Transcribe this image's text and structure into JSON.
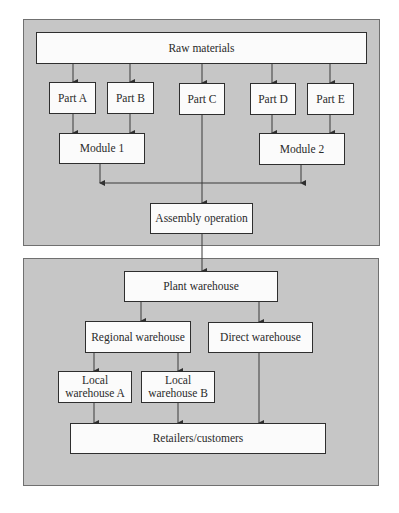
{
  "diagram": {
    "type": "supply-chain flowchart",
    "colors": {
      "panel": "#c6c6c6",
      "box": "#fbfbfb",
      "border": "#2e2e2e",
      "line": "#3a3a3a"
    },
    "panels": [
      {
        "id": "production",
        "label": ""
      },
      {
        "id": "distribution",
        "label": ""
      }
    ],
    "nodes": {
      "raw_materials": "Raw materials",
      "part_a": "Part A",
      "part_b": "Part B",
      "part_c": "Part C",
      "part_d": "Part D",
      "part_e": "Part E",
      "module_1": "Module 1",
      "module_2": "Module 2",
      "assembly": "Assembly operation",
      "plant_warehouse": "Plant warehouse",
      "regional_warehouse": "Regional warehouse",
      "direct_warehouse": "Direct warehouse",
      "local_warehouse_a": "Local\nwarehouse A",
      "local_warehouse_b": "Local\nwarehouse B",
      "retailers": "Retailers/customers"
    },
    "edges": [
      [
        "raw_materials",
        "part_a"
      ],
      [
        "raw_materials",
        "part_b"
      ],
      [
        "raw_materials",
        "part_c"
      ],
      [
        "raw_materials",
        "part_d"
      ],
      [
        "raw_materials",
        "part_e"
      ],
      [
        "part_a",
        "module_1"
      ],
      [
        "part_b",
        "module_1"
      ],
      [
        "part_d",
        "module_2"
      ],
      [
        "part_e",
        "module_2"
      ],
      [
        "module_1",
        "assembly"
      ],
      [
        "part_c",
        "assembly"
      ],
      [
        "module_2",
        "assembly"
      ],
      [
        "assembly",
        "plant_warehouse"
      ],
      [
        "plant_warehouse",
        "regional_warehouse"
      ],
      [
        "plant_warehouse",
        "direct_warehouse"
      ],
      [
        "regional_warehouse",
        "local_warehouse_a"
      ],
      [
        "regional_warehouse",
        "local_warehouse_b"
      ],
      [
        "local_warehouse_a",
        "retailers"
      ],
      [
        "local_warehouse_b",
        "retailers"
      ],
      [
        "direct_warehouse",
        "retailers"
      ]
    ]
  }
}
